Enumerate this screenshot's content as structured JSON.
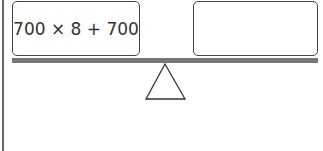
{
  "diagram": {
    "type": "balance-scale",
    "left_pan": {
      "expression": "700 × 8 + 700"
    },
    "right_pan": {
      "expression": ""
    },
    "colors": {
      "beam": "#777777",
      "border": "#444444"
    }
  }
}
